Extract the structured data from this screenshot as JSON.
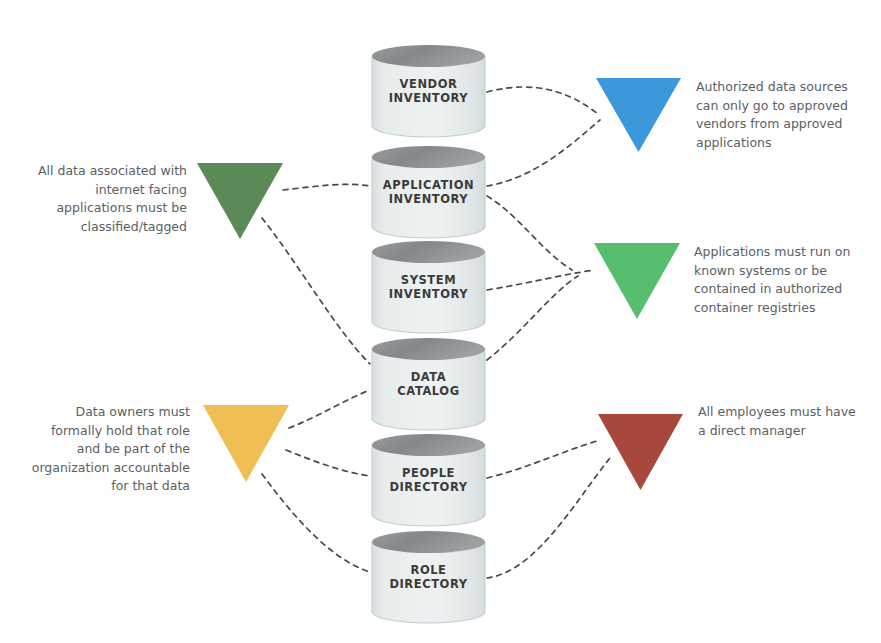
{
  "diagram": {
    "background_color": "#ffffff",
    "connector_style": "dashed-curve",
    "connector_color": "#4a4a4a"
  },
  "databases": [
    {
      "id": "vendor-inventory",
      "label": "VENDOR\nINVENTORY",
      "x": 372,
      "y": 45,
      "width": 113,
      "height": 92
    },
    {
      "id": "application-inventory",
      "label": "APPLICATION\nINVENTORY",
      "x": 372,
      "y": 146,
      "width": 113,
      "height": 92
    },
    {
      "id": "system-inventory",
      "label": "SYSTEM\nINVENTORY",
      "x": 372,
      "y": 241,
      "width": 113,
      "height": 92
    },
    {
      "id": "data-catalog",
      "label": "DATA\nCATALOG",
      "x": 372,
      "y": 338,
      "width": 113,
      "height": 92
    },
    {
      "id": "people-directory",
      "label": "PEOPLE\nDIRECTORY",
      "x": 372,
      "y": 434,
      "width": 113,
      "height": 92
    },
    {
      "id": "role-directory",
      "label": "ROLE\nDIRECTORY",
      "x": 372,
      "y": 531,
      "width": 113,
      "height": 92
    }
  ],
  "database_style": {
    "body_color": "#e7ecec",
    "body_color_bottom": "#dfe5e6",
    "top_color": "#8e9193",
    "edge_color": "#b9c0c1",
    "label_color": "#3b3b3b"
  },
  "policies": [
    {
      "id": "classification-policy",
      "side": "left",
      "color": "#5b8a56",
      "text": "All data associated with\ninternet facing\napplications must be\nclassified/tagged",
      "triangle": {
        "x": 197,
        "y": 163,
        "width": 86,
        "height": 76
      },
      "text_box": {
        "x": 35,
        "y": 162,
        "width": 152
      }
    },
    {
      "id": "data-owner-policy",
      "side": "left",
      "color": "#f0be53",
      "text": "Data owners must\nformally hold that role\nand be part of the\norganization accountable\nfor that data",
      "triangle": {
        "x": 203,
        "y": 405,
        "width": 86,
        "height": 77
      },
      "text_box": {
        "x": 25,
        "y": 403,
        "width": 165
      }
    },
    {
      "id": "authorized-sources-policy",
      "side": "right",
      "color": "#3d97db",
      "text": "Authorized data sources\ncan only go to approved\nvendors from approved\napplications",
      "triangle": {
        "x": 596,
        "y": 78,
        "width": 85,
        "height": 74
      },
      "text_box": {
        "x": 696,
        "y": 78,
        "width": 175
      }
    },
    {
      "id": "known-systems-policy",
      "side": "right",
      "color": "#56be6e",
      "text": "Applications must run on\nknown systems or be\ncontained in authorized\ncontainer registries",
      "triangle": {
        "x": 594,
        "y": 243,
        "width": 86,
        "height": 76
      },
      "text_box": {
        "x": 694,
        "y": 243,
        "width": 178
      }
    },
    {
      "id": "direct-manager-policy",
      "side": "right",
      "color": "#a8483c",
      "text": "All employees must have\na direct manager",
      "triangle": {
        "x": 598,
        "y": 414,
        "width": 85,
        "height": 76
      },
      "text_box": {
        "x": 698,
        "y": 403,
        "width": 175
      }
    }
  ],
  "connectors": [
    {
      "id": "vendor-to-authorized",
      "from": "vendor-inventory",
      "to": "authorized-sources-policy",
      "path": "M 487 92 C 540 78, 575 96, 598 114"
    },
    {
      "id": "application-to-authorized",
      "from": "application-inventory",
      "to": "authorized-sources-policy",
      "path": "M 487 186 C 535 178, 572 144, 600 120"
    },
    {
      "id": "application-to-known",
      "from": "application-inventory",
      "to": "known-systems-policy",
      "path": "M 487 196 C 520 216, 540 250, 572 270"
    },
    {
      "id": "system-to-known",
      "from": "system-inventory",
      "to": "known-systems-policy",
      "path": "M 487 290 C 525 284, 555 276, 594 270"
    },
    {
      "id": "catalog-to-known",
      "from": "data-catalog",
      "to": "known-systems-policy",
      "path": "M 487 360 C 525 330, 552 292, 578 276"
    },
    {
      "id": "people-to-manager",
      "from": "people-directory",
      "to": "direct-manager-policy",
      "path": "M 487 478 C 528 468, 560 452, 600 440"
    },
    {
      "id": "role-to-manager",
      "from": "role-directory",
      "to": "direct-manager-policy",
      "path": "M 487 578 C 536 572, 576 500, 610 458"
    },
    {
      "id": "classification-to-application",
      "from": "classification-policy",
      "to": "application-inventory",
      "path": "M 283 190 C 318 186, 344 182, 370 186"
    },
    {
      "id": "classification-to-catalog",
      "from": "classification-policy",
      "to": "data-catalog",
      "path": "M 262 218 C 300 266, 336 330, 370 364"
    },
    {
      "id": "owner-to-catalog",
      "from": "data-owner-policy",
      "to": "data-catalog",
      "path": "M 289 428 C 320 416, 344 400, 370 390"
    },
    {
      "id": "owner-to-people",
      "from": "data-owner-policy",
      "to": "people-directory",
      "path": "M 286 450 C 316 462, 342 472, 370 476"
    },
    {
      "id": "owner-to-role",
      "from": "data-owner-policy",
      "to": "role-directory",
      "path": "M 262 474 C 296 520, 332 560, 370 572"
    }
  ]
}
